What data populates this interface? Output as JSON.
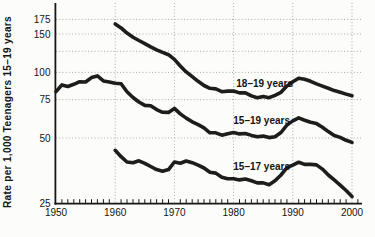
{
  "figure": {
    "background_color": "#fcfcfa",
    "line_color": "#1d1d1d",
    "grid_color": "#aaaaaa",
    "text_color": "#141414"
  },
  "chart_data": {
    "type": "line",
    "title": "",
    "xlabel": "",
    "ylabel": "Rate per 1,000 Teenagers 15–19 years",
    "y_scale": "log",
    "grid": "dotted",
    "legend_position": "inline-labels",
    "xlim": [
      1950,
      2001.7
    ],
    "ylim": [
      25,
      208
    ],
    "x_ticks": [
      1950,
      1960,
      1970,
      1980,
      1990,
      2000
    ],
    "x_minor_tick_step_years": 1,
    "x_gridlines": [
      1960,
      1970,
      1980,
      1990,
      2000
    ],
    "y_ticks": [
      175,
      150,
      100,
      75,
      50,
      25
    ],
    "y_gridlines": [
      175,
      150,
      125,
      100,
      75,
      50
    ],
    "series": [
      {
        "name": "18–19 years",
        "start_year": 1960,
        "step_years": 1,
        "values": [
          166.7,
          160.0,
          151.5,
          145.0,
          140.0,
          135.5,
          131.0,
          127.0,
          123.5,
          120.5,
          114.7,
          107.0,
          100.5,
          95.5,
          91.0,
          87.0,
          84.5,
          84.0,
          81.5,
          82.0,
          82.1,
          80.5,
          80.5,
          78.0,
          76.5,
          77.5,
          76.5,
          78.5,
          81.0,
          86.5,
          90.5,
          94.0,
          93.0,
          91.0,
          88.5,
          86.5,
          84.5,
          82.5,
          81.0,
          79.5,
          78.1
        ]
      },
      {
        "name": "15–19 years",
        "start_year": 1950,
        "step_years": 1,
        "values": [
          81.6,
          87.6,
          86.1,
          88.2,
          90.6,
          90.3,
          94.6,
          96.3,
          91.4,
          90.4,
          89.1,
          88.6,
          81.4,
          76.7,
          73.1,
          70.5,
          70.3,
          67.5,
          65.6,
          65.5,
          68.3,
          64.5,
          61.7,
          59.3,
          57.5,
          55.6,
          52.8,
          52.8,
          51.5,
          52.3,
          53.0,
          52.2,
          52.4,
          51.4,
          50.6,
          51.0,
          50.2,
          50.6,
          53.0,
          57.3,
          59.9,
          61.8,
          60.3,
          59.0,
          58.2,
          56.0,
          53.5,
          51.3,
          50.3,
          48.8,
          47.7
        ]
      },
      {
        "name": "15–17 years",
        "start_year": 1960,
        "step_years": 1,
        "values": [
          43.9,
          41.0,
          38.8,
          38.5,
          39.3,
          38.2,
          37.0,
          35.8,
          35.2,
          35.8,
          38.8,
          38.3,
          39.2,
          38.5,
          37.5,
          36.4,
          34.8,
          34.5,
          33.0,
          32.5,
          32.5,
          32.1,
          32.4,
          31.8,
          31.1,
          31.1,
          30.5,
          31.8,
          33.8,
          36.5,
          37.5,
          38.7,
          37.8,
          37.8,
          37.6,
          36.0,
          33.8,
          32.1,
          30.4,
          28.7,
          26.9
        ]
      }
    ]
  }
}
